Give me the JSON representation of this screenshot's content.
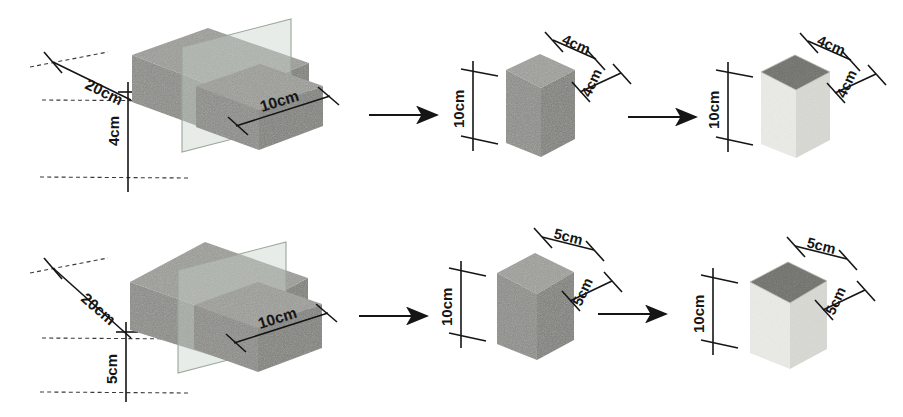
{
  "figure": {
    "type": "technical-diagram",
    "background_color": "#ffffff",
    "rows": 2,
    "columns": 3
  },
  "colors": {
    "block_front": "#8d8d8a",
    "block_top": "#9a9a96",
    "block_side": "#7b7b78",
    "block_dark": "#6f6f6c",
    "cut_plane": "#c9d2cb",
    "cut_plane_edge": "#9aa79c",
    "light_block_body": "#e9e9e5",
    "light_block_side": "#d9d9d4",
    "light_block_top": "#6f6f6a",
    "line": "#151515",
    "dashed_line": "#3a3a3a"
  },
  "rows": [
    {
      "id": "row-1",
      "specimen": "4cm series",
      "panels": [
        {
          "id": "panel-1-1",
          "name": "full-block-with-cutting-plane",
          "labels": [
            {
              "text": "20cm",
              "dimension": "length",
              "value": 20,
              "unit": "cm"
            },
            {
              "text": "10cm",
              "dimension": "width",
              "value": 10,
              "unit": "cm"
            },
            {
              "text": "4cm",
              "dimension": "height",
              "value": 4,
              "unit": "cm"
            }
          ]
        },
        {
          "id": "panel-1-2",
          "name": "cut-prism",
          "labels": [
            {
              "text": "10cm",
              "dimension": "height",
              "value": 10,
              "unit": "cm"
            },
            {
              "text": "4cm",
              "dimension": "top-depth",
              "value": 4,
              "unit": "cm"
            },
            {
              "text": "4cm",
              "dimension": "side-width",
              "value": 4,
              "unit": "cm"
            }
          ]
        },
        {
          "id": "panel-1-3",
          "name": "coated-prism",
          "labels": [
            {
              "text": "10cm",
              "dimension": "height",
              "value": 10,
              "unit": "cm"
            },
            {
              "text": "4cm",
              "dimension": "top-depth",
              "value": 4,
              "unit": "cm"
            },
            {
              "text": "4cm",
              "dimension": "side-width",
              "value": 4,
              "unit": "cm"
            }
          ]
        }
      ]
    },
    {
      "id": "row-2",
      "specimen": "5cm series",
      "panels": [
        {
          "id": "panel-2-1",
          "name": "full-block-with-cutting-plane",
          "labels": [
            {
              "text": "20cm",
              "dimension": "length",
              "value": 20,
              "unit": "cm"
            },
            {
              "text": "10cm",
              "dimension": "width",
              "value": 10,
              "unit": "cm"
            },
            {
              "text": "5cm",
              "dimension": "height",
              "value": 5,
              "unit": "cm"
            }
          ]
        },
        {
          "id": "panel-2-2",
          "name": "cut-prism",
          "labels": [
            {
              "text": "10cm",
              "dimension": "height",
              "value": 10,
              "unit": "cm"
            },
            {
              "text": "5cm",
              "dimension": "top-depth",
              "value": 5,
              "unit": "cm"
            },
            {
              "text": "5cm",
              "dimension": "side-width",
              "value": 5,
              "unit": "cm"
            }
          ]
        },
        {
          "id": "panel-2-3",
          "name": "coated-prism",
          "labels": [
            {
              "text": "10cm",
              "dimension": "height",
              "value": 10,
              "unit": "cm"
            },
            {
              "text": "5cm",
              "dimension": "top-depth",
              "value": 5,
              "unit": "cm"
            },
            {
              "text": "5cm",
              "dimension": "side-width",
              "value": 5,
              "unit": "cm"
            }
          ]
        }
      ]
    }
  ],
  "arrows": [
    {
      "id": "arrow-1",
      "from": "panel-1-1",
      "to": "panel-1-2",
      "direction": "right"
    },
    {
      "id": "arrow-2",
      "from": "panel-1-2",
      "to": "panel-1-3",
      "direction": "right"
    },
    {
      "id": "arrow-3",
      "from": "panel-2-1",
      "to": "panel-2-2",
      "direction": "right"
    },
    {
      "id": "arrow-4",
      "from": "panel-2-2",
      "to": "panel-2-3",
      "direction": "right"
    }
  ]
}
